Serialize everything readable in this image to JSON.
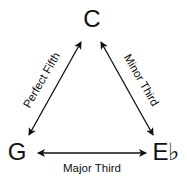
{
  "diagram": {
    "nodes": {
      "top": "C",
      "left": "G",
      "right": "E♭"
    },
    "edges": {
      "left": "Perfect Fifth",
      "right": "Minor Third",
      "bottom": "Major Third"
    },
    "colors": {
      "ink": "#111111",
      "background": "#ffffff"
    }
  }
}
